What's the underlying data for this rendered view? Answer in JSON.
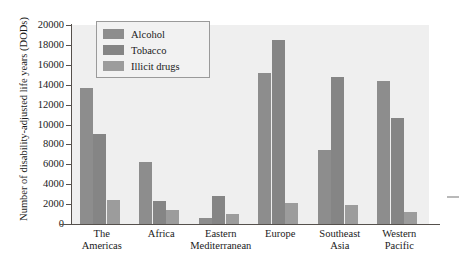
{
  "chart_data": {
    "type": "bar",
    "title": "",
    "xlabel": "",
    "ylabel": "Number of disability-adjusted life years (DODs)",
    "ylim": [
      0,
      20000
    ],
    "ytick_step": 2000,
    "yticks": [
      "20000",
      "18000",
      "16000",
      "14000",
      "12000",
      "10000",
      "8000",
      "6000",
      "4000",
      "2000",
      "0"
    ],
    "grid": false,
    "legend_position": "top-left-inside",
    "categories": [
      [
        "The",
        "Americas"
      ],
      [
        "Africa"
      ],
      [
        "Eastern",
        "Mediterranean"
      ],
      [
        "Europe"
      ],
      [
        "Southeast",
        "Asia"
      ],
      [
        "Western",
        "Pacific"
      ]
    ],
    "category_names": [
      "The Americas",
      "Africa",
      "Eastern Mediterranean",
      "Europe",
      "Southeast Asia",
      "Western Pacific"
    ],
    "series": [
      {
        "name": "Alcohol",
        "color": "#8d8d8d",
        "values": [
          13700,
          6200,
          600,
          15200,
          7400,
          14400
        ]
      },
      {
        "name": "Tobacco",
        "color": "#858585",
        "values": [
          9000,
          2300,
          2800,
          18500,
          14800,
          10700
        ]
      },
      {
        "name": "Illicit drugs",
        "color": "#9c9c9c",
        "values": [
          2400,
          1400,
          1000,
          2100,
          1900,
          1200
        ]
      }
    ]
  },
  "legend": {
    "items": [
      {
        "label": "Alcohol"
      },
      {
        "label": "Tobacco"
      },
      {
        "label": "Illicit drugs"
      }
    ]
  }
}
